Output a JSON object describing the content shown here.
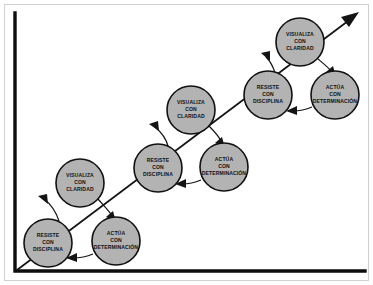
{
  "diagram": {
    "type": "cycle-staircase",
    "colors": {
      "node_fill": "#b3b3b3",
      "node_stroke": "#111111",
      "axis": "#0d0d0d",
      "arrow": "#141414",
      "frame": "#cfcfcf",
      "background": "#ffffff"
    },
    "axes": {
      "y_axis_name": "vertical-axis",
      "x_axis_name": "horizontal-axis"
    },
    "growth_arrow": {
      "name": "growth-trend-arrow",
      "direction": "up-right"
    },
    "step_labels": {
      "visualiza": {
        "line1": "VISUALIZA",
        "line2": "CON",
        "line3": "CLARIDAD"
      },
      "resiste": {
        "line1": "RESISTE",
        "line2": "CON",
        "line3": "DISCIPLINA"
      },
      "actua": {
        "line1": "ACTÚA",
        "line2": "CON",
        "line3": "DETERMINACIÓN"
      }
    },
    "nodes": [
      {
        "id": "resiste-1",
        "step": "resiste",
        "cx": 48,
        "cy": 243,
        "r": 24,
        "l1": "RESISTE",
        "l2": "CON",
        "l3": "DISCIPLINA"
      },
      {
        "id": "actua-1",
        "step": "actua",
        "cx": 116,
        "cy": 241,
        "r": 24,
        "l1": "ACTÚA",
        "l2": "CON",
        "l3": "DETERMINACIÓN"
      },
      {
        "id": "visualiza-1",
        "step": "visualiza",
        "cx": 80,
        "cy": 183,
        "r": 24,
        "l1": "VISUALIZA",
        "l2": "CON",
        "l3": "CLARIDAD"
      },
      {
        "id": "resiste-2",
        "step": "resiste",
        "cx": 158,
        "cy": 168,
        "r": 24,
        "l1": "RESISTE",
        "l2": "CON",
        "l3": "DISCIPLINA"
      },
      {
        "id": "actua-2",
        "step": "actua",
        "cx": 224,
        "cy": 167,
        "r": 24,
        "l1": "ACTÚA",
        "l2": "CON",
        "l3": "DETERMINACIÓN"
      },
      {
        "id": "visualiza-2",
        "step": "visualiza",
        "cx": 191,
        "cy": 110,
        "r": 24,
        "l1": "VISUALIZA",
        "l2": "CON",
        "l3": "CLARIDAD"
      },
      {
        "id": "resiste-3",
        "step": "resiste",
        "cx": 268,
        "cy": 95,
        "r": 24,
        "l1": "RESISTE",
        "l2": "CON",
        "l3": "DISCIPLINA"
      },
      {
        "id": "actua-3",
        "step": "actua",
        "cx": 335,
        "cy": 95,
        "r": 24,
        "l1": "ACTÚA",
        "l2": "CON",
        "l3": "DETERMINACIÓN"
      },
      {
        "id": "visualiza-3",
        "step": "visualiza",
        "cx": 300,
        "cy": 42,
        "r": 24,
        "l1": "VISUALIZA",
        "l2": "CON",
        "l3": "CLARIDAD"
      }
    ]
  }
}
